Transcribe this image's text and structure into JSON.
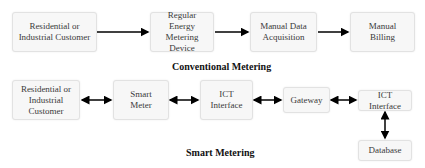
{
  "conventional": {
    "title": "Conventional Metering",
    "boxes": [
      {
        "label": "Residential or Industrial Customer"
      },
      {
        "label": "Regular Energy Metering Device"
      },
      {
        "label": "Manual Data Acquisition"
      },
      {
        "label": "Manual Billing"
      }
    ],
    "connectors": "one-directional arrows left to right"
  },
  "smart": {
    "title": "Smart Metering",
    "boxes": [
      {
        "label": "Residential or Industrial Customer"
      },
      {
        "label": "Smart Meter"
      },
      {
        "label": "ICT Interface"
      },
      {
        "label": "Gateway"
      },
      {
        "label": "ICT Interface"
      },
      {
        "label": "Database"
      }
    ],
    "connectors": "bidirectional arrows"
  },
  "colors": {
    "box_fill": "#f7f7f7",
    "box_border": "#e2e2e2",
    "arrow": "#000000",
    "text": "#3a3a3a"
  }
}
